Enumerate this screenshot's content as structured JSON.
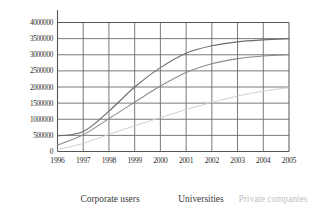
{
  "chart_data": {
    "type": "line",
    "title": "",
    "subtitle": "",
    "xlabel": "",
    "ylabel": "",
    "grid": true,
    "legend_position": "bottom",
    "categories": [
      "1996",
      "1997",
      "1998",
      "1999",
      "2000",
      "2001",
      "2002",
      "2003",
      "2004",
      "2005"
    ],
    "x": [
      1996,
      1997,
      1998,
      1999,
      2000,
      2001,
      2002,
      2003,
      2004,
      2005
    ],
    "xlim": [
      1996,
      2005
    ],
    "ylim": [
      0,
      4000000
    ],
    "yticks": [
      0,
      500000,
      1000000,
      1500000,
      2000000,
      2500000,
      3000000,
      3500000,
      4000000
    ],
    "ytick_labels": [
      "0",
      "500000",
      "1000000",
      "1500000",
      "2000000",
      "2500000",
      "3000000",
      "3500000",
      "4000000"
    ],
    "xtick_labels": [
      "1996",
      "1997",
      "1998",
      "1999",
      "2000",
      "2001",
      "2002",
      "2003",
      "2004",
      "2005"
    ],
    "series": [
      {
        "name": "Corporate users",
        "color": "#6b6b6b",
        "values": [
          480000,
          620000,
          1250000,
          2000000,
          2600000,
          3050000,
          3280000,
          3400000,
          3460000,
          3500000
        ]
      },
      {
        "name": "Universities",
        "color": "#8a8a8a",
        "values": [
          200000,
          520000,
          1020000,
          1530000,
          2030000,
          2450000,
          2720000,
          2880000,
          2960000,
          3000000
        ]
      },
      {
        "name": "Private companies",
        "color": "#d0d0d0",
        "values": [
          60000,
          250000,
          530000,
          800000,
          1050000,
          1300000,
          1520000,
          1720000,
          1870000,
          1980000
        ]
      }
    ]
  },
  "legend": {
    "items": [
      {
        "label": "Corporate users",
        "color": "#3b3b3b"
      },
      {
        "label": "Universities",
        "color": "#3b3b3b"
      },
      {
        "label": "Private companies",
        "color": "#c2c2c2"
      }
    ]
  }
}
